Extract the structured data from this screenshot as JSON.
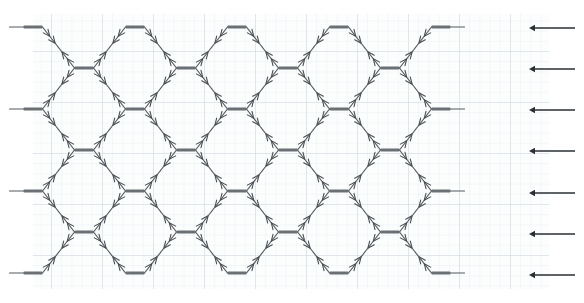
{
  "canvas": {
    "width": 584,
    "height": 303,
    "background_color": "#ffffff",
    "title": "diagonal-lattice-network-on-graph-paper"
  },
  "graph_paper": {
    "visible": true,
    "region": {
      "x": 33,
      "y": 14,
      "width": 516,
      "height": 275
    },
    "minor_spacing": 10.2,
    "major_spacing": 51,
    "minor_color": "#e9eef2",
    "major_color": "#ced8df",
    "paper_color": "#fcfdfd"
  },
  "lattice": {
    "description": "diamond lattice of 45-degree strands joined at horizontal bar nodes",
    "line_color": "#555a5e",
    "line_width": 1.2,
    "node_color": "#6b7075",
    "node_bar_width": 19,
    "node_bar_height": 3.2,
    "origin_x": 33,
    "origin_y": 27,
    "col_pitch": 51,
    "row_pitch": 41,
    "columns": 9,
    "rows": 7,
    "half_col": 25.5,
    "half_row": 20.5,
    "tick": {
      "shape": "arrowhead-tick",
      "length": 7,
      "color": "#4a4f53",
      "per_segment": 2
    },
    "node_columns_even": [
      0,
      2,
      4,
      6,
      8
    ],
    "node_columns_odd": [
      1,
      3,
      5,
      7
    ],
    "stub_length": 14
  },
  "rail_arrows": {
    "count": 7,
    "direction": "left",
    "color": "#2b2f33",
    "shaft_length": 46,
    "head_size": 6,
    "x_tail": 575,
    "x_head": 529,
    "items": [
      {
        "index": 1,
        "y": 28,
        "label": "row-1-output-arrow"
      },
      {
        "index": 2,
        "y": 69,
        "label": "row-2-output-arrow"
      },
      {
        "index": 3,
        "y": 110,
        "label": "row-3-output-arrow"
      },
      {
        "index": 4,
        "y": 151,
        "label": "row-4-output-arrow"
      },
      {
        "index": 5,
        "y": 193,
        "label": "row-5-output-arrow"
      },
      {
        "index": 6,
        "y": 234,
        "label": "row-6-output-arrow"
      },
      {
        "index": 7,
        "y": 275,
        "label": "row-7-output-arrow"
      }
    ]
  },
  "chart_data": {
    "type": "diagram",
    "title": "",
    "xlabel": "",
    "ylabel": "",
    "legend": [],
    "annotations": [],
    "node_rows": 7,
    "node_columns": 9
  }
}
